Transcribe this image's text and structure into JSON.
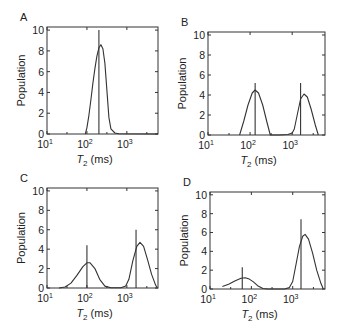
{
  "figure": {
    "width": 341,
    "height": 334,
    "line_color": "#333333"
  },
  "chart_data": [
    {
      "type": "line",
      "panel_label": "A",
      "title": "",
      "xlabel": "T2 (ms)",
      "xlabel_main": "T",
      "xlabel_sub": "2",
      "xlabel_rest": " (ms)",
      "ylabel": "Population",
      "xscale": "log",
      "xlim_log10": [
        1,
        3.78
      ],
      "ylim": [
        0,
        10.3
      ],
      "xticks": [
        {
          "label_base": "10",
          "label_exp": "1",
          "log10": 1
        },
        {
          "label_base": "10",
          "label_exp": "2",
          "log10": 2
        },
        {
          "label_base": "10",
          "label_exp": "3",
          "log10": 3
        }
      ],
      "yticks": [
        0,
        2,
        4,
        6,
        8,
        10
      ],
      "grid": false,
      "box": {
        "x": 47,
        "y": 27,
        "w": 111,
        "h": 107
      },
      "curve": [
        [
          1.96,
          0
        ],
        [
          2.0,
          0.6
        ],
        [
          2.05,
          1.8
        ],
        [
          2.1,
          3.3
        ],
        [
          2.15,
          4.9
        ],
        [
          2.2,
          6.3
        ],
        [
          2.25,
          7.5
        ],
        [
          2.3,
          8.3
        ],
        [
          2.35,
          8.6
        ],
        [
          2.4,
          8.2
        ],
        [
          2.45,
          6.8
        ],
        [
          2.5,
          4.2
        ],
        [
          2.55,
          1.6
        ],
        [
          2.6,
          0.5
        ],
        [
          2.7,
          0.1
        ],
        [
          2.8,
          0.03
        ],
        [
          3.78,
          0
        ]
      ],
      "sticks": [
        {
          "log10": 2.3,
          "value": 10.0
        }
      ]
    },
    {
      "type": "line",
      "panel_label": "B",
      "title": "",
      "xlabel": "T2 (ms)",
      "xlabel_main": "T",
      "xlabel_sub": "2",
      "xlabel_rest": " (ms)",
      "ylabel": "Population",
      "xscale": "log",
      "xlim_log10": [
        1,
        3.78
      ],
      "ylim": [
        0,
        10.3
      ],
      "xticks": [
        {
          "label_base": "10",
          "label_exp": "1",
          "log10": 1
        },
        {
          "label_base": "10",
          "label_exp": "2",
          "log10": 2
        },
        {
          "label_base": "10",
          "label_exp": "3",
          "log10": 3
        }
      ],
      "yticks": [
        0,
        2,
        4,
        6,
        8,
        10
      ],
      "grid": false,
      "box": {
        "x": 208,
        "y": 32,
        "w": 117,
        "h": 103
      },
      "curve": [
        [
          1.75,
          0
        ],
        [
          1.85,
          1.4
        ],
        [
          1.95,
          3.0
        ],
        [
          2.05,
          4.2
        ],
        [
          2.12,
          4.5
        ],
        [
          2.2,
          4.2
        ],
        [
          2.3,
          3.0
        ],
        [
          2.4,
          1.3
        ],
        [
          2.48,
          0
        ],
        [
          2.7,
          0
        ],
        [
          2.9,
          0.05
        ],
        [
          3.0,
          0.2
        ],
        [
          3.05,
          0.6
        ],
        [
          3.12,
          2.0
        ],
        [
          3.2,
          3.6
        ],
        [
          3.28,
          4.1
        ],
        [
          3.36,
          3.8
        ],
        [
          3.45,
          2.6
        ],
        [
          3.55,
          1.0
        ],
        [
          3.62,
          0
        ]
      ],
      "sticks": [
        {
          "log10": 2.12,
          "value": 5.2
        },
        {
          "log10": 3.2,
          "value": 5.2
        }
      ]
    },
    {
      "type": "line",
      "panel_label": "C",
      "title": "",
      "xlabel": "T2 (ms)",
      "xlabel_main": "T",
      "xlabel_sub": "2",
      "xlabel_rest": " (ms)",
      "ylabel": "Population",
      "xscale": "log",
      "xlim_log10": [
        1,
        3.78
      ],
      "ylim": [
        0,
        10.3
      ],
      "xticks": [
        {
          "label_base": "10",
          "label_exp": "1",
          "log10": 1
        },
        {
          "label_base": "10",
          "label_exp": "2",
          "log10": 2
        },
        {
          "label_base": "10",
          "label_exp": "3",
          "log10": 3
        }
      ],
      "yticks": [
        0,
        2,
        4,
        6,
        8,
        10
      ],
      "grid": false,
      "box": {
        "x": 47,
        "y": 188,
        "w": 111,
        "h": 100
      },
      "curve": [
        [
          1.3,
          0
        ],
        [
          1.45,
          0.1
        ],
        [
          1.6,
          0.5
        ],
        [
          1.75,
          1.3
        ],
        [
          1.9,
          2.2
        ],
        [
          2.0,
          2.6
        ],
        [
          2.08,
          2.6
        ],
        [
          2.2,
          2.0
        ],
        [
          2.32,
          0.9
        ],
        [
          2.45,
          0.2
        ],
        [
          2.6,
          0.03
        ],
        [
          2.85,
          0.02
        ],
        [
          2.97,
          0.2
        ],
        [
          3.05,
          0.9
        ],
        [
          3.15,
          2.8
        ],
        [
          3.25,
          4.3
        ],
        [
          3.33,
          4.7
        ],
        [
          3.42,
          4.3
        ],
        [
          3.52,
          2.9
        ],
        [
          3.62,
          1.4
        ],
        [
          3.72,
          0.3
        ],
        [
          3.76,
          0
        ]
      ],
      "sticks": [
        {
          "log10": 2.0,
          "value": 4.4
        },
        {
          "log10": 3.23,
          "value": 6.0
        }
      ]
    },
    {
      "type": "line",
      "panel_label": "D",
      "title": "",
      "xlabel": "T2 (ms)",
      "xlabel_main": "T",
      "xlabel_sub": "2",
      "xlabel_rest": " (ms)",
      "ylabel": "Population",
      "xscale": "log",
      "xlim_log10": [
        1,
        3.78
      ],
      "ylim": [
        0,
        10.3
      ],
      "xticks": [
        {
          "label_base": "10",
          "label_exp": "1",
          "log10": 1
        },
        {
          "label_base": "10",
          "label_exp": "2",
          "log10": 2
        },
        {
          "label_base": "10",
          "label_exp": "3",
          "log10": 3
        }
      ],
      "yticks": [
        0,
        2,
        4,
        6,
        8,
        10
      ],
      "grid": false,
      "box": {
        "x": 210,
        "y": 192,
        "w": 115,
        "h": 97
      },
      "curve": [
        [
          1.3,
          0.25
        ],
        [
          1.45,
          0.5
        ],
        [
          1.6,
          0.85
        ],
        [
          1.75,
          1.15
        ],
        [
          1.85,
          1.2
        ],
        [
          1.95,
          1.05
        ],
        [
          2.05,
          0.75
        ],
        [
          2.15,
          0.35
        ],
        [
          2.28,
          0.05
        ],
        [
          2.4,
          0
        ],
        [
          2.8,
          0
        ],
        [
          2.92,
          0.15
        ],
        [
          3.0,
          0.8
        ],
        [
          3.08,
          2.6
        ],
        [
          3.16,
          4.5
        ],
        [
          3.24,
          5.6
        ],
        [
          3.3,
          5.8
        ],
        [
          3.38,
          5.3
        ],
        [
          3.48,
          3.8
        ],
        [
          3.58,
          2.0
        ],
        [
          3.68,
          0.6
        ],
        [
          3.74,
          0
        ]
      ],
      "sticks": [
        {
          "log10": 1.78,
          "value": 2.3
        },
        {
          "log10": 3.2,
          "value": 7.4
        }
      ]
    }
  ]
}
